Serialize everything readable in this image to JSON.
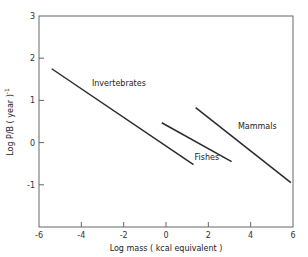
{
  "chart_data": {
    "type": "line",
    "title": "",
    "xlabel": "Log mass  ( kcal equivalent )",
    "ylabel": "Log  P/B ( year )",
    "ylabel_superscript": "-1",
    "xlim": [
      -6,
      6
    ],
    "ylim": [
      -2,
      3
    ],
    "xticks": [
      -6,
      -4,
      -2,
      0,
      2,
      4,
      6
    ],
    "yticks": [
      -2,
      -1,
      0,
      1,
      2,
      3
    ],
    "xtick_labels": [
      "-6",
      "-4",
      "-2",
      "0",
      "2",
      "4",
      "6"
    ],
    "ytick_labels": [
      "",
      "-1",
      "0",
      "1",
      "2",
      "3"
    ],
    "grid": false,
    "legend": "inline labels",
    "series": [
      {
        "name": "Invertebrates",
        "x": [
          -5.4,
          1.3
        ],
        "y": [
          1.75,
          -0.52
        ],
        "label": "Invertebrates",
        "label_pos": [
          -3.5,
          1.35
        ]
      },
      {
        "name": "Fishes",
        "x": [
          -0.2,
          3.1
        ],
        "y": [
          0.47,
          -0.45
        ],
        "label": "Fishes",
        "label_pos": [
          1.35,
          -0.42
        ]
      },
      {
        "name": "Mammals",
        "x": [
          1.4,
          5.9
        ],
        "y": [
          0.83,
          -0.95
        ],
        "label": "Mammals",
        "label_pos": [
          3.4,
          0.33
        ]
      }
    ]
  },
  "colors": {
    "line": "#2a2a2a",
    "axis": "#555555",
    "background": "#ffffff"
  }
}
